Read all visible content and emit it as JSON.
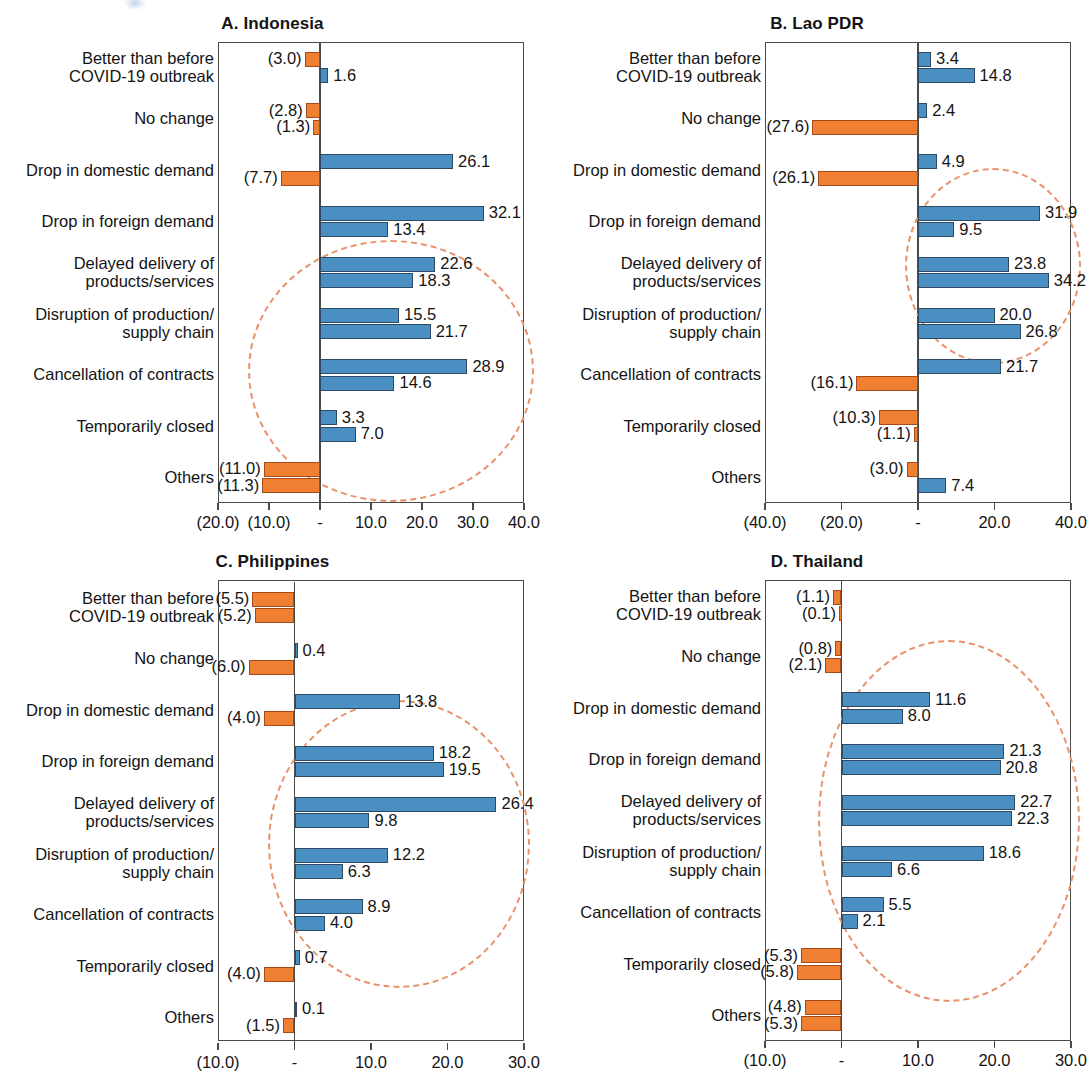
{
  "figure": {
    "categories": [
      "Better than before\nCOVID-19 outbreak",
      "No change",
      "Drop in domestic demand",
      "Drop in foreign demand",
      "Delayed delivery of\nproducts/services",
      "Disruption of production/\nsupply chain",
      "Cancellation of contracts",
      "Temporarily closed",
      "Others"
    ]
  },
  "chart_data": [
    {
      "type": "bar",
      "panel_id": "A",
      "title": "A. Indonesia",
      "orientation": "horizontal",
      "xlabel": "",
      "ylabel": "",
      "xlim": [
        -20.0,
        40.0
      ],
      "grid": false,
      "legend": "none",
      "tick_labels": [
        "(20.0)",
        "(10.0)",
        "-",
        "10.0",
        "20.0",
        "30.0",
        "40.0"
      ],
      "ticks": [
        -20.0,
        -10.0,
        0.0,
        10.0,
        20.0,
        30.0,
        40.0
      ],
      "categories": [
        "Better than before\nCOVID-19 outbreak",
        "No change",
        "Drop in domestic demand",
        "Drop in foreign demand",
        "Delayed delivery of\nproducts/services",
        "Disruption of production/\nsupply chain",
        "Cancellation of contracts",
        "Temporarily closed",
        "Others"
      ],
      "series": [
        {
          "name": "first",
          "values": [
            -3.0,
            -2.8,
            26.1,
            32.1,
            22.6,
            15.5,
            28.9,
            3.3,
            -11.0
          ],
          "labels": [
            "(3.0)",
            "(2.8)",
            "26.1",
            "32.1",
            "22.6",
            "15.5",
            "28.9",
            "3.3",
            "(11.0)"
          ]
        },
        {
          "name": "second",
          "values": [
            1.6,
            -1.3,
            -7.7,
            13.4,
            18.3,
            21.7,
            14.6,
            7.0,
            -11.3
          ],
          "labels": [
            "1.6",
            "(1.3)",
            "(7.7)",
            "13.4",
            "18.3",
            "21.7",
            "14.6",
            "7.0",
            "(11.3)"
          ]
        }
      ],
      "annotation": "dashed ellipse highlighting rows 4-8"
    },
    {
      "type": "bar",
      "panel_id": "B",
      "title": "B. Lao PDR",
      "orientation": "horizontal",
      "xlabel": "",
      "ylabel": "",
      "xlim": [
        -40.0,
        40.0
      ],
      "grid": false,
      "legend": "none",
      "tick_labels": [
        "(40.0)",
        "(20.0)",
        "-",
        "20.0",
        "40.0"
      ],
      "ticks": [
        -40.0,
        -20.0,
        0.0,
        20.0,
        40.0
      ],
      "categories": [
        "Better than before\nCOVID-19 outbreak",
        "No change",
        "Drop in domestic demand",
        "Drop in foreign demand",
        "Delayed delivery of\nproducts/services",
        "Disruption of production/\nsupply chain",
        "Cancellation of contracts",
        "Temporarily closed",
        "Others"
      ],
      "series": [
        {
          "name": "first",
          "values": [
            3.4,
            2.4,
            4.9,
            31.9,
            23.8,
            20.0,
            21.7,
            -10.3,
            -3.0
          ],
          "labels": [
            "3.4",
            "2.4",
            "4.9",
            "31.9",
            "23.8",
            "20.0",
            "21.7",
            "(10.3)",
            "(3.0)"
          ]
        },
        {
          "name": "second",
          "values": [
            14.8,
            -27.6,
            -26.1,
            9.5,
            34.2,
            26.8,
            -16.1,
            -1.1,
            7.4
          ],
          "labels": [
            "14.8",
            "(27.6)",
            "(26.1)",
            "9.5",
            "34.2",
            "26.8",
            "(16.1)",
            "(1.1)",
            "7.4"
          ]
        }
      ],
      "annotation": "dashed ellipse highlighting rows 4-6"
    },
    {
      "type": "bar",
      "panel_id": "C",
      "title": "C. Philippines",
      "orientation": "horizontal",
      "xlabel": "",
      "ylabel": "",
      "xlim": [
        -10.0,
        30.0
      ],
      "grid": false,
      "legend": "none",
      "tick_labels": [
        "(10.0)",
        "-",
        "10.0",
        "20.0",
        "30.0"
      ],
      "ticks": [
        -10.0,
        0.0,
        10.0,
        20.0,
        30.0
      ],
      "categories": [
        "Better than before\nCOVID-19 outbreak",
        "No change",
        "Drop in domestic demand",
        "Drop in foreign demand",
        "Delayed delivery of\nproducts/services",
        "Disruption of production/\nsupply chain",
        "Cancellation of contracts",
        "Temporarily closed",
        "Others"
      ],
      "series": [
        {
          "name": "first",
          "values": [
            -5.5,
            0.4,
            13.8,
            18.2,
            26.4,
            12.2,
            8.9,
            0.7,
            0.1
          ],
          "labels": [
            "(5.5)",
            "0.4",
            "13.8",
            "18.2",
            "26.4",
            "12.2",
            "8.9",
            "0.7",
            "0.1"
          ]
        },
        {
          "name": "second",
          "values": [
            -5.2,
            -6.0,
            -4.0,
            19.5,
            9.8,
            6.3,
            4.0,
            -4.0,
            -1.5
          ],
          "labels": [
            "(5.2)",
            "(6.0)",
            "(4.0)",
            "19.5",
            "9.8",
            "6.3",
            "4.0",
            "(4.0)",
            "(1.5)"
          ]
        }
      ],
      "annotation": "dashed ellipse highlighting rows 4-8"
    },
    {
      "type": "bar",
      "panel_id": "D",
      "title": "D. Thailand",
      "orientation": "horizontal",
      "xlabel": "",
      "ylabel": "",
      "xlim": [
        -10.0,
        30.0
      ],
      "grid": false,
      "legend": "none",
      "tick_labels": [
        "(10.0)",
        "-",
        "10.0",
        "20.0",
        "30.0"
      ],
      "ticks": [
        -10.0,
        0.0,
        10.0,
        20.0,
        30.0
      ],
      "categories": [
        "Better than before\nCOVID-19 outbreak",
        "No change",
        "Drop in domestic demand",
        "Drop in foreign demand",
        "Delayed delivery of\nproducts/services",
        "Disruption of production/\nsupply chain",
        "Cancellation of contracts",
        "Temporarily closed",
        "Others"
      ],
      "series": [
        {
          "name": "first",
          "values": [
            -1.1,
            -0.8,
            11.6,
            21.3,
            22.7,
            18.6,
            5.5,
            -5.3,
            -4.8
          ],
          "labels": [
            "(1.1)",
            "(0.8)",
            "11.6",
            "21.3",
            "22.7",
            "18.6",
            "5.5",
            "(5.3)",
            "(4.8)"
          ]
        },
        {
          "name": "second",
          "values": [
            -0.1,
            -2.1,
            8.0,
            20.8,
            22.3,
            6.6,
            2.1,
            -5.8,
            -5.3
          ],
          "labels": [
            "(0.1)",
            "(2.1)",
            "8.0",
            "20.8",
            "22.3",
            "6.6",
            "2.1",
            "(5.8)",
            "(5.3)"
          ]
        }
      ],
      "annotation": "dashed ellipse highlighting rows 2-8"
    }
  ],
  "colors": {
    "positive_bar": "#4a8fc2",
    "negative_bar": "#ef7f31",
    "bar_outline": "#2e4a63",
    "axis": "#4a4a4a",
    "ellipse": "#e8926b",
    "text": "#141414"
  }
}
